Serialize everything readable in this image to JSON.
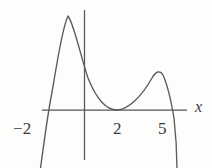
{
  "figure": {
    "title": "",
    "background_color": "#fdfdfc",
    "line_color": "#5a5a5a",
    "axis_color": "#555555",
    "text_color": "#3b3b3b",
    "width": 212,
    "height": 168
  },
  "axes": {
    "x_axis_label": "x",
    "y_axis_label": "",
    "x_tick_labels": [
      "−2",
      "2",
      "5"
    ],
    "x_tick_values": [
      -2,
      2,
      5
    ],
    "y_tick_labels": [],
    "grid": "off",
    "legend": "none"
  },
  "chart_data": {
    "type": "line",
    "title": "",
    "xlabel": "x",
    "ylabel": "",
    "grid": false,
    "legend_position": "none",
    "xlim": [
      -3.1,
      6.6
    ],
    "ylim": [
      -7.5,
      9.2
    ],
    "x_ticks": [
      -2,
      2,
      5
    ],
    "x_tick_labels": [
      "−2",
      "2",
      "5"
    ],
    "y_ticks": [],
    "roots": [
      -2,
      2,
      5
    ],
    "root_notes": [
      "simple root at x = -2 (curve crosses upward)",
      "double root at x = 2 (curve touches axis, tangent from above)",
      "simple root at x = 5 (curve crosses downward)"
    ],
    "local_extrema": [
      {
        "type": "local_maximum",
        "x": -0.6,
        "y": 8.4
      },
      {
        "type": "local_minimum",
        "x": 2.0,
        "y": 0.0
      },
      {
        "type": "local_maximum",
        "x": 4.0,
        "y": 3.5
      }
    ],
    "series": [
      {
        "name": "y = f(x)",
        "x": [
          -2.75,
          -2.5,
          -2.25,
          -2.0,
          -1.75,
          -1.5,
          -1.25,
          -1.0,
          -0.75,
          -0.5,
          -0.25,
          0.0,
          0.25,
          0.5,
          0.75,
          1.0,
          1.25,
          1.5,
          1.75,
          2.0,
          2.25,
          2.5,
          2.75,
          3.0,
          3.25,
          3.5,
          3.75,
          4.0,
          4.25,
          4.5,
          4.75,
          5.0,
          5.25,
          5.5,
          5.75,
          6.0
        ],
        "y": [
          -7.3,
          -5.0,
          -2.6,
          0.0,
          3.0,
          5.6,
          7.4,
          8.2,
          8.4,
          8.2,
          7.2,
          6.0,
          4.6,
          3.3,
          2.1,
          1.2,
          0.6,
          0.2,
          0.05,
          0.0,
          0.35,
          1.0,
          1.8,
          2.5,
          3.0,
          3.35,
          3.5,
          3.5,
          3.2,
          2.6,
          1.6,
          0.0,
          -1.9,
          -4.2,
          -6.2,
          -7.5
        ]
      }
    ]
  },
  "curve_path": "M 40,172 C 43,150 47,118 52,92 C 57,64 62,28 68,16 C 74,24 80,54 88,78 C 96,98 106,110 117,110 C 128,110 142,96 152,78 C 156,71 160,70 163,75 C 167,84 171,100 174,118 C 176,136 177,158 177,172",
  "axis_geometry": {
    "x_axis": {
      "x1": 42,
      "y1": 110,
      "x2": 187,
      "y2": 110
    },
    "y_axis": {
      "x1": 84,
      "y1": 10,
      "x2": 84,
      "y2": 160
    }
  }
}
